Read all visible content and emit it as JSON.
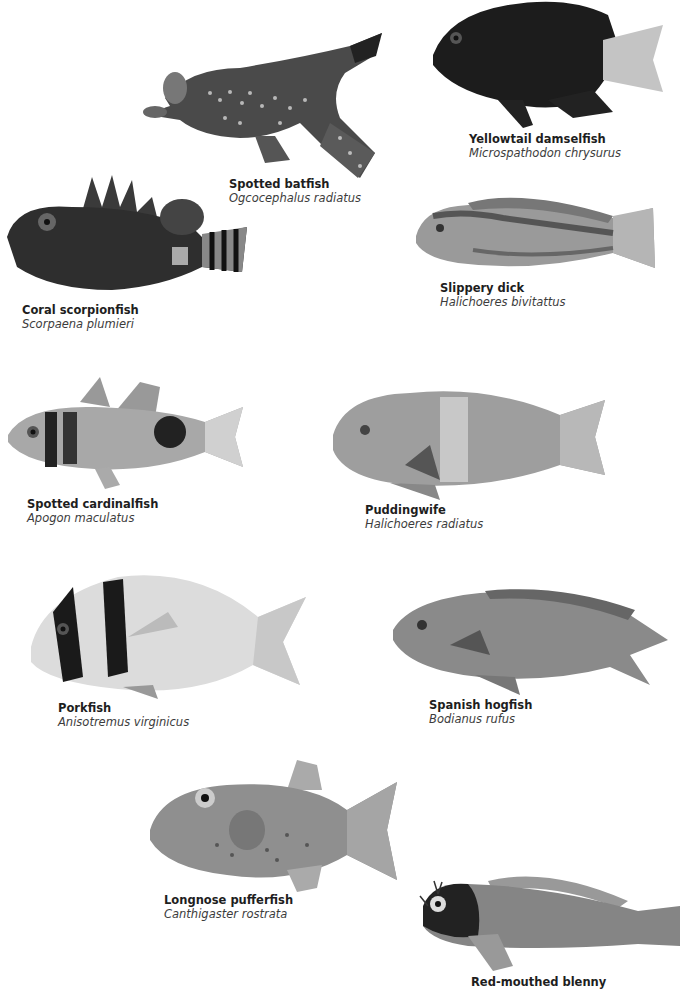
{
  "species": [
    {
      "id": "batfish",
      "common": "Spotted batfish",
      "scientific": "Ogcocephalus radiatus"
    },
    {
      "id": "damselfish",
      "common": "Yellowtail damselfish",
      "scientific": "Microspathodon chrysurus"
    },
    {
      "id": "scorpionfish",
      "common": "Coral scorpionfish",
      "scientific": "Scorpaena plumieri"
    },
    {
      "id": "slippery-dick",
      "common": "Slippery dick",
      "scientific": "Halichoeres bivitattus"
    },
    {
      "id": "cardinalfish",
      "common": "Spotted cardinalfish",
      "scientific": "Apogon maculatus"
    },
    {
      "id": "puddingwife",
      "common": "Puddingwife",
      "scientific": "Halichoeres radiatus"
    },
    {
      "id": "porkfish",
      "common": "Porkfish",
      "scientific": "Anisotremus virginicus"
    },
    {
      "id": "hogfish",
      "common": "Spanish hogfish",
      "scientific": "Bodianus rufus"
    },
    {
      "id": "pufferfish",
      "common": "Longnose pufferfish",
      "scientific": "Canthigaster rostrata"
    },
    {
      "id": "blenny",
      "common": "Red-mouthed blenny",
      "scientific": ""
    }
  ]
}
